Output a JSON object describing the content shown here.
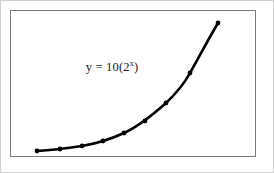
{
  "figure": {
    "label_prefix": "y = 10(2",
    "label_exponent": "x",
    "label_suffix": ")",
    "frame_color": "#7c7c7c",
    "outer_border_color": "#cfcfcf",
    "curve_color": "#000000",
    "background_color": "#ffffff"
  },
  "chart_data": {
    "type": "line",
    "subtitle": "",
    "xlabel": "",
    "ylabel": "",
    "grid": false,
    "legend": "none",
    "annotations": [
      {
        "text": "y = 10(2^x)",
        "x_px": 108,
        "y_px": 70
      }
    ],
    "equation": "y = 10(2^x)",
    "xlim": [
      0,
      4.5
    ],
    "ylim": [
      0,
      240
    ],
    "x": [
      0,
      0.7,
      1.3,
      1.9,
      2.4,
      2.9,
      3.4,
      3.8,
      4.2
    ],
    "values": [
      10,
      16,
      25,
      37,
      53,
      75,
      105,
      139,
      184
    ],
    "series": [
      {
        "name": "y = 10(2^x)",
        "x": [
          0,
          0.7,
          1.3,
          1.9,
          2.4,
          2.9,
          3.4,
          3.8,
          4.2
        ],
        "values": [
          10,
          16,
          25,
          37,
          53,
          75,
          105,
          139,
          184
        ]
      }
    ],
    "points_px": [
      {
        "x": 37,
        "y": 151
      },
      {
        "x": 60,
        "y": 149
      },
      {
        "x": 82,
        "y": 146
      },
      {
        "x": 103,
        "y": 141
      },
      {
        "x": 124,
        "y": 133
      },
      {
        "x": 145,
        "y": 121
      },
      {
        "x": 166,
        "y": 103
      },
      {
        "x": 190,
        "y": 73
      },
      {
        "x": 218,
        "y": 23
      }
    ],
    "marker": "circle",
    "marker_size_px": 3,
    "line_width_px": 2.6
  }
}
